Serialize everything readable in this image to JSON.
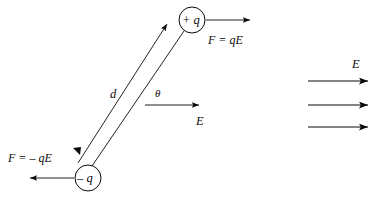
{
  "figure": {
    "stroke_color": "#0a0a0a",
    "background_color": "#ffffff"
  },
  "charges": {
    "positive": {
      "label": "+ q",
      "cx": 192,
      "cy": 20,
      "r": 13
    },
    "negative": {
      "label": "– q",
      "cx": 88,
      "cy": 178,
      "r": 13
    }
  },
  "forces": {
    "positive": {
      "label": "F = qE",
      "x": 208,
      "y": 34
    },
    "negative": {
      "label": "F = – qE",
      "x": 8,
      "y": 152
    }
  },
  "separation": {
    "label": "d",
    "x": 110,
    "y": 88
  },
  "angle": {
    "label": "θ",
    "x": 155,
    "y": 88
  },
  "field_vector": {
    "label": "E",
    "x": 196,
    "y": 115
  },
  "uniform_field": {
    "label": "E",
    "label_x": 352,
    "label_y": 58,
    "lines": [
      {
        "x1": 308,
        "y1": 81,
        "x2": 368,
        "y2": 81
      },
      {
        "x1": 308,
        "y1": 105,
        "x2": 368,
        "y2": 105
      },
      {
        "x1": 308,
        "y1": 127,
        "x2": 368,
        "y2": 127
      }
    ]
  }
}
